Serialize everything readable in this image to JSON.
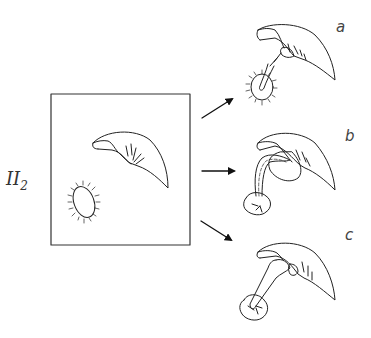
{
  "figure": {
    "main_label": "II",
    "main_label_subscript": "2",
    "panels": [
      {
        "label": "a"
      },
      {
        "label": "b"
      },
      {
        "label": "c"
      }
    ],
    "colors": {
      "stroke": "#222222",
      "background": "#ffffff"
    }
  }
}
